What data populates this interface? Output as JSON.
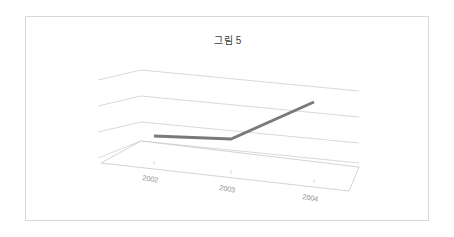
{
  "figure": {
    "title": "그림 5",
    "border_color": "#d8d8d8",
    "background_color": "#ffffff"
  },
  "chart_data": {
    "type": "line",
    "title": "그림 5",
    "subtitle": "",
    "xlabel": "",
    "ylabel": "",
    "categories": [
      "2002",
      "2003",
      "2004"
    ],
    "tick_labels": [
      "2002",
      "2003",
      "2004"
    ],
    "series": [
      {
        "name": "series1",
        "values": [
          1,
          1,
          3
        ],
        "color": "#7a7a7a",
        "line_width": 3
      }
    ],
    "ylim": [
      0,
      4
    ],
    "y_gridline_count": 4,
    "grid": true,
    "legend": false,
    "legend_position": "none",
    "projection": "3d"
  },
  "geometry": {
    "gridline_color": "#c9c9c9",
    "floor_edge_color": "#c0c0c0",
    "series_color": "#7a7a7a",
    "tick_mark_color": "#c9c9c9",
    "walls": [
      {
        "left_x": 72,
        "left_y": 63,
        "back_x": 115,
        "back_y": 53,
        "right_x": 333,
        "right_y": 74
      },
      {
        "left_x": 72,
        "left_y": 89,
        "back_x": 115,
        "back_y": 79,
        "right_x": 333,
        "right_y": 100
      },
      {
        "left_x": 72,
        "left_y": 115,
        "back_x": 115,
        "back_y": 105,
        "right_x": 333,
        "right_y": 126
      },
      {
        "left_x": 72,
        "left_y": 141,
        "back_x": 115,
        "back_y": 124,
        "right_x": 333,
        "right_y": 146
      }
    ],
    "floor": {
      "back_left_x": 115,
      "back_left_y": 124,
      "back_right_x": 333,
      "back_right_y": 150,
      "front_right_x": 323,
      "front_right_y": 174,
      "front_left_x": 75,
      "front_left_y": 146
    },
    "data_points": [
      {
        "x": 128,
        "y": 119
      },
      {
        "x": 205,
        "y": 122
      },
      {
        "x": 288,
        "y": 85
      }
    ],
    "tick_positions": [
      {
        "x": 128,
        "y": 147
      },
      {
        "x": 205,
        "y": 156
      },
      {
        "x": 288,
        "y": 165
      }
    ],
    "label_positions": [
      {
        "x": 116,
        "y": 163,
        "rotate": 9
      },
      {
        "x": 193,
        "y": 173,
        "rotate": 9
      },
      {
        "x": 276,
        "y": 182,
        "rotate": 9
      }
    ]
  }
}
